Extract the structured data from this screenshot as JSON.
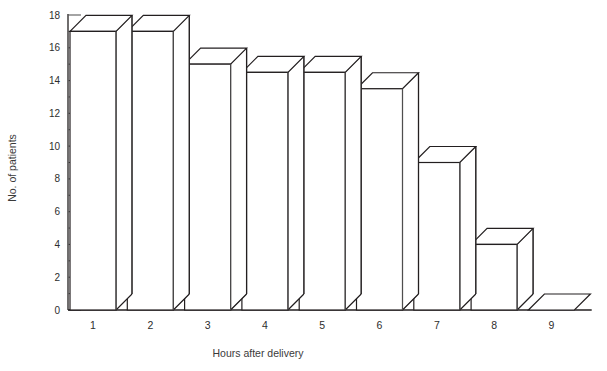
{
  "chart_data": {
    "type": "bar",
    "title": "",
    "subtitle": "",
    "xlabel": "Hours after delivery",
    "ylabel": "No. of patients",
    "categories": [
      "1",
      "2",
      "3",
      "4",
      "5",
      "6",
      "7",
      "8",
      "9"
    ],
    "values": [
      17,
      17,
      15,
      14.5,
      14.5,
      13.5,
      9,
      4,
      0
    ],
    "ylim": [
      0,
      18
    ],
    "y_major_ticks": [
      0,
      2,
      4,
      6,
      8,
      10,
      12,
      14,
      16,
      18
    ],
    "y_minor_ticks": [
      1,
      3,
      5,
      7,
      9,
      11,
      13,
      15,
      17
    ],
    "y_tick_labels": [
      "0",
      "2",
      "4",
      "6",
      "8",
      "10",
      "12",
      "14",
      "16",
      "18"
    ],
    "grid": false,
    "legend": false,
    "legend_position": "none",
    "style": "3d-isometric-bars",
    "colors": {
      "bar_face": "#ffffff",
      "bar_outline": "#231f20",
      "bar_top": "#ffffff",
      "bar_side": "#ffffff",
      "axis": "#231f20",
      "text": "#2d2d2d"
    }
  },
  "axes": {
    "y_title": "No. of patients",
    "x_title": "Hours after delivery"
  }
}
